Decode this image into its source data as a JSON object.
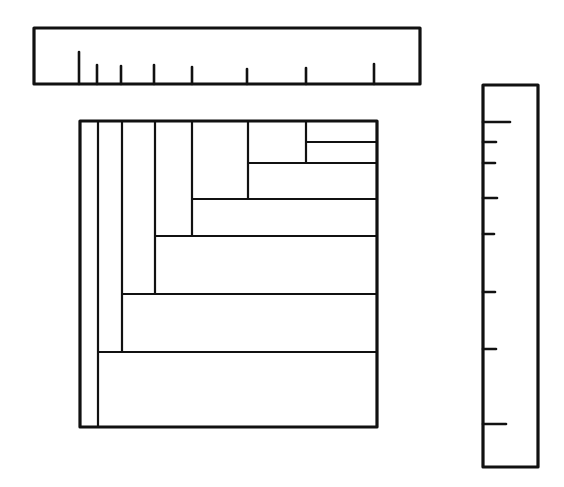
{
  "diagram": {
    "type": "proportional-area-diagram",
    "colors": {
      "line": "#111111",
      "background": "#ffffff"
    },
    "top_ruler": {
      "box": {
        "x": 34,
        "y": 28,
        "w": 386,
        "h": 56
      },
      "baseline_y": 84,
      "ticks": [
        {
          "x": 79,
          "top": 52
        },
        {
          "x": 97,
          "top": 65
        },
        {
          "x": 121,
          "top": 66
        },
        {
          "x": 154,
          "top": 65
        },
        {
          "x": 192,
          "top": 67
        },
        {
          "x": 247,
          "top": 69
        },
        {
          "x": 306,
          "top": 68
        },
        {
          "x": 374,
          "top": 64
        }
      ]
    },
    "side_ruler": {
      "box": {
        "x": 483,
        "y": 85,
        "w": 55,
        "h": 382
      },
      "left_x": 483,
      "ticks": [
        {
          "y": 122,
          "len": 27
        },
        {
          "y": 142,
          "len": 13
        },
        {
          "y": 163,
          "len": 12
        },
        {
          "y": 198,
          "len": 14
        },
        {
          "y": 234,
          "len": 11
        },
        {
          "y": 292,
          "len": 12
        },
        {
          "y": 349,
          "len": 13
        },
        {
          "y": 424,
          "len": 23
        }
      ]
    },
    "square": {
      "box": {
        "x": 80,
        "y": 121,
        "w": 297,
        "h": 306
      },
      "verticals": [
        {
          "x": 98,
          "y1": 121,
          "y2": 427
        },
        {
          "x": 122,
          "y1": 121,
          "y2": 352
        },
        {
          "x": 155,
          "y1": 121,
          "y2": 294
        },
        {
          "x": 192,
          "y1": 121,
          "y2": 236
        },
        {
          "x": 248,
          "y1": 121,
          "y2": 199
        },
        {
          "x": 306,
          "y1": 121,
          "y2": 163
        }
      ],
      "horizontals": [
        {
          "y": 142,
          "x1": 306,
          "x2": 377
        },
        {
          "y": 163,
          "x1": 248,
          "x2": 377
        },
        {
          "y": 199,
          "x1": 192,
          "x2": 377
        },
        {
          "y": 236,
          "x1": 155,
          "x2": 377
        },
        {
          "y": 294,
          "x1": 122,
          "x2": 377
        },
        {
          "y": 352,
          "x1": 98,
          "x2": 377
        }
      ]
    }
  }
}
